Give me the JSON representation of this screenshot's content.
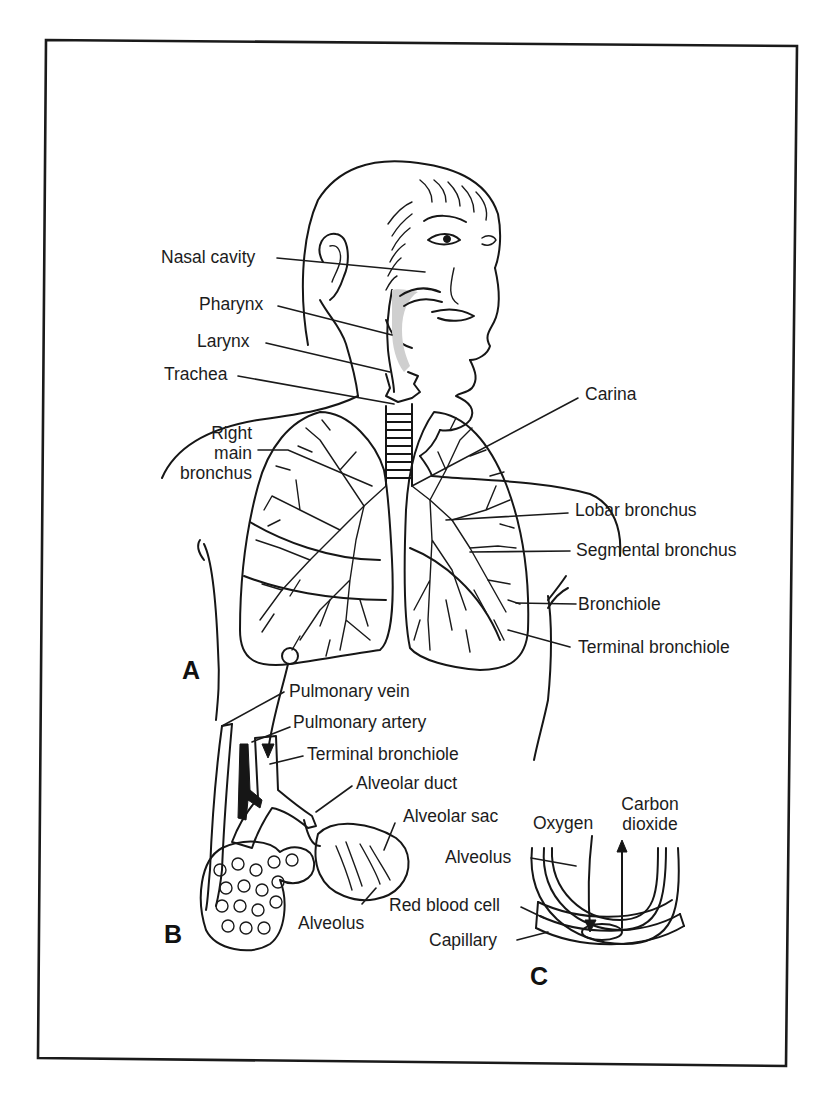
{
  "figure": {
    "panels": [
      {
        "id": "A",
        "letter": "A",
        "description": "Respiratory tract overview"
      },
      {
        "id": "B",
        "letter": "B",
        "description": "Terminal bronchiole and alveolar sacs"
      },
      {
        "id": "C",
        "letter": "C",
        "description": "Gas exchange at alveolus"
      }
    ],
    "labels": {
      "panel_a": {
        "nasal_cavity": "Nasal cavity",
        "pharynx": "Pharynx",
        "larynx": "Larynx",
        "trachea": "Trachea",
        "right_main_bronchus_line1": "Right",
        "right_main_bronchus_line2": "main",
        "right_main_bronchus_line3": "bronchus",
        "carina": "Carina",
        "lobar_bronchus": "Lobar bronchus",
        "segmental_bronchus": "Segmental bronchus",
        "bronchiole": "Bronchiole",
        "terminal_bronchiole": "Terminal bronchiole"
      },
      "panel_b": {
        "pulmonary_vein": "Pulmonary vein",
        "pulmonary_artery": "Pulmonary artery",
        "terminal_bronchiole": "Terminal bronchiole",
        "alveolar_duct": "Alveolar duct",
        "alveolar_sac": "Alveolar sac",
        "alveolus": "Alveolus"
      },
      "panel_c": {
        "oxygen": "Oxygen",
        "carbon_dioxide_line1": "Carbon",
        "carbon_dioxide_line2": "dioxide",
        "alveolus": "Alveolus",
        "red_blood_cell": "Red blood cell",
        "capillary": "Capillary"
      }
    },
    "colors": {
      "ink": "#161616",
      "background": "#ffffff"
    }
  }
}
